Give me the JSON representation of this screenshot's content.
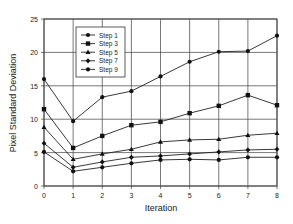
{
  "chart_data": {
    "type": "line",
    "title": "",
    "xlabel": "Iteration",
    "ylabel": "Pixel Standard Deviation",
    "x": [
      0,
      1,
      2,
      3,
      4,
      5,
      6,
      7,
      8
    ],
    "xlim": [
      0,
      8
    ],
    "ylim": [
      0,
      25
    ],
    "xticks": [
      "0",
      "1",
      "2",
      "3",
      "4",
      "5",
      "6",
      "7",
      "8"
    ],
    "yticks": [
      "0",
      "5",
      "10",
      "15",
      "20",
      "25"
    ],
    "grid": true,
    "legend_position": "upper-left-inside",
    "series": [
      {
        "name": "Step 1",
        "marker": "circle",
        "values": [
          16.0,
          9.7,
          13.3,
          14.2,
          16.4,
          18.6,
          20.1,
          20.2,
          22.5
        ]
      },
      {
        "name": "Step 3",
        "marker": "square",
        "values": [
          11.5,
          5.7,
          7.5,
          9.1,
          9.6,
          10.9,
          12.0,
          13.6,
          12.1
        ]
      },
      {
        "name": "Step 5",
        "marker": "triangle",
        "values": [
          8.8,
          4.0,
          4.8,
          5.5,
          6.6,
          6.9,
          7.0,
          7.6,
          7.9
        ]
      },
      {
        "name": "Step 7",
        "marker": "diamond",
        "values": [
          6.4,
          2.8,
          3.6,
          4.3,
          4.5,
          4.8,
          5.1,
          5.4,
          5.5
        ]
      },
      {
        "name": "Step 9",
        "marker": "circle",
        "values": [
          5.1,
          2.2,
          2.8,
          3.4,
          3.9,
          4.0,
          3.9,
          4.3,
          4.3
        ]
      }
    ]
  }
}
